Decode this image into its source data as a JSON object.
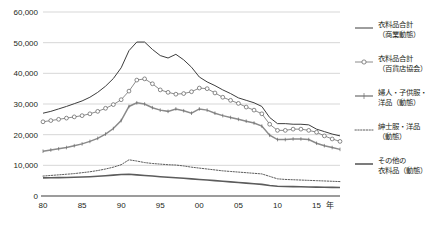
{
  "chart_data": {
    "type": "line",
    "title": "",
    "xlabel": "年",
    "ylabel": "",
    "ylim": [
      0,
      60000
    ],
    "xlim": [
      1980,
      2018
    ],
    "grid": true,
    "legend_position": "right",
    "y_ticks": [
      "0",
      "10,000",
      "20,000",
      "30,000",
      "40,000",
      "50,000",
      "60,000"
    ],
    "y_tick_values": [
      0,
      10000,
      20000,
      30000,
      40000,
      50000,
      60000
    ],
    "x_ticks": [
      "80",
      "85",
      "90",
      "95",
      "00",
      "05",
      "10",
      "15"
    ],
    "x_tick_values": [
      1980,
      1985,
      1990,
      1995,
      2000,
      2005,
      2010,
      2015
    ],
    "x_axis_unit": "年",
    "x": [
      1980,
      1981,
      1982,
      1983,
      1984,
      1985,
      1986,
      1987,
      1988,
      1989,
      1990,
      1991,
      1992,
      1993,
      1994,
      1995,
      1996,
      1997,
      1998,
      1999,
      2000,
      2001,
      2002,
      2003,
      2004,
      2005,
      2006,
      2007,
      2008,
      2009,
      2010,
      2011,
      2012,
      2013,
      2014,
      2015,
      2016,
      2017,
      2018
    ],
    "series": [
      {
        "name": "衣料品合計（商業動態）",
        "marker": "none",
        "style": "solid-thin",
        "color": "#3d3d3d",
        "values": [
          27000,
          27600,
          28400,
          29200,
          30100,
          31000,
          32200,
          33800,
          35800,
          38300,
          41800,
          47400,
          50200,
          50200,
          47800,
          45800,
          45000,
          46200,
          44400,
          42000,
          38800,
          37200,
          36000,
          34600,
          33400,
          32000,
          31200,
          30400,
          29200,
          25600,
          23600,
          23600,
          23400,
          23400,
          23200,
          21800,
          21000,
          20200,
          19600
        ]
      },
      {
        "name": "衣料品合計（百貨店協会）",
        "marker": "circle",
        "style": "solid-thin-marker",
        "color": "#6e6e6e",
        "values": [
          24200,
          24600,
          25000,
          25400,
          25800,
          26200,
          26800,
          27600,
          28600,
          29800,
          31400,
          34200,
          37800,
          38200,
          36600,
          34600,
          33800,
          33200,
          33400,
          34000,
          35200,
          35000,
          33600,
          32200,
          31200,
          30200,
          29000,
          28000,
          26800,
          23400,
          21400,
          21400,
          21800,
          21800,
          21400,
          20800,
          19600,
          18600,
          17800
        ]
      },
      {
        "name": "婦人・子供服・洋品（動態）",
        "marker": "plus",
        "style": "solid-thick",
        "color": "#8a8a8a",
        "values": [
          14600,
          15000,
          15400,
          15800,
          16400,
          17000,
          17800,
          18800,
          20200,
          22000,
          24600,
          29200,
          30400,
          30000,
          28800,
          28000,
          27600,
          28400,
          27800,
          27000,
          28400,
          28000,
          27000,
          26200,
          25600,
          25000,
          24400,
          23800,
          22800,
          19800,
          18400,
          18400,
          18600,
          18600,
          18400,
          17200,
          16400,
          15800,
          15200
        ]
      },
      {
        "name": "紳士服・洋品（動態）",
        "marker": "none",
        "style": "dotted",
        "color": "#4a4a4a",
        "values": [
          6500,
          6700,
          6900,
          7100,
          7300,
          7600,
          7900,
          8300,
          8800,
          9400,
          10200,
          11800,
          11400,
          10900,
          10600,
          10400,
          10200,
          10100,
          9800,
          9400,
          9100,
          8800,
          8500,
          8200,
          8000,
          7800,
          7600,
          7400,
          7200,
          6400,
          5600,
          5400,
          5300,
          5200,
          5100,
          5000,
          4900,
          4800,
          4700
        ]
      },
      {
        "name": "その他の衣料品（動態）",
        "marker": "none",
        "style": "solid-thickest",
        "color": "#5c5c5c",
        "values": [
          5900,
          5950,
          6000,
          6050,
          6100,
          6200,
          6300,
          6450,
          6600,
          6800,
          7000,
          7100,
          6900,
          6700,
          6500,
          6300,
          6100,
          5950,
          5800,
          5600,
          5400,
          5200,
          5000,
          4800,
          4600,
          4400,
          4200,
          4000,
          3800,
          3400,
          3200,
          3100,
          3050,
          3000,
          2950,
          2900,
          2850,
          2800,
          2750
        ]
      }
    ]
  },
  "legend": {
    "items": [
      {
        "label_line1": "衣料品合計",
        "label_line2": "（商業動態）",
        "style": "solid-thin",
        "marker": "none"
      },
      {
        "label_line1": "衣料品合計",
        "label_line2": "（百貨店協会）",
        "style": "solid-thin-marker",
        "marker": "circle"
      },
      {
        "label_line1": "婦人・子供服・",
        "label_line2": "洋品（動態）",
        "style": "solid-thick",
        "marker": "plus"
      },
      {
        "label_line1": "紳士服・洋品",
        "label_line2": "（動態）",
        "style": "dotted",
        "marker": "none"
      },
      {
        "label_line1": "その他の",
        "label_line2": "衣料品（動態）",
        "style": "solid-thickest",
        "marker": "none"
      }
    ]
  }
}
